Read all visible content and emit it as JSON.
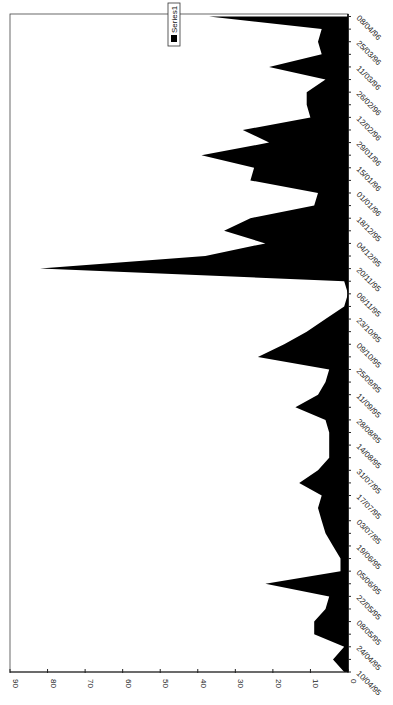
{
  "chart_data": {
    "type": "area",
    "orientation": "rotated-90-clockwise",
    "title": "",
    "xlabel": "",
    "ylabel": "",
    "ylim": [
      0,
      90
    ],
    "y_ticks": [
      0,
      10,
      20,
      30,
      40,
      50,
      60,
      70,
      80,
      90
    ],
    "x_tick_labels": [
      "10/04/95",
      "24/04/95",
      "08/05/95",
      "22/05/95",
      "05/06/95",
      "19/06/95",
      "03/07/95",
      "17/07/95",
      "31/07/95",
      "14/08/95",
      "28/08/95",
      "11/09/95",
      "25/09/95",
      "09/10/95",
      "23/10/95",
      "06/11/95",
      "20/11/95",
      "04/12/95",
      "18/12/95",
      "01/01/96",
      "15/01/96",
      "29/01/96",
      "12/02/96",
      "26/02/96",
      "11/03/96",
      "25/03/96",
      "08/04/96"
    ],
    "grid": false,
    "legend": {
      "position": "top",
      "entries": [
        "Series1"
      ]
    },
    "fill_color": "#000000",
    "x": [
      "10/04/95",
      "17/04/95",
      "24/04/95",
      "01/05/95",
      "08/05/95",
      "15/05/95",
      "22/05/95",
      "29/05/95",
      "05/06/95",
      "12/06/95",
      "19/06/95",
      "26/06/95",
      "03/07/95",
      "10/07/95",
      "17/07/95",
      "24/07/95",
      "31/07/95",
      "07/08/95",
      "14/08/95",
      "21/08/95",
      "28/08/95",
      "04/09/95",
      "11/09/95",
      "18/09/95",
      "25/09/95",
      "02/10/95",
      "09/10/95",
      "16/10/95",
      "23/10/95",
      "30/10/95",
      "06/11/95",
      "13/11/95",
      "20/11/95",
      "27/11/95",
      "04/12/95",
      "11/12/95",
      "18/12/95",
      "25/12/95",
      "01/01/96",
      "08/01/96",
      "15/01/96",
      "22/01/96",
      "29/01/96",
      "05/02/96",
      "12/02/96",
      "19/02/96",
      "26/02/96",
      "04/03/96",
      "11/03/96",
      "18/03/96",
      "25/03/96",
      "01/04/96",
      "08/04/96"
    ],
    "series": [
      {
        "name": "Series1",
        "values": [
          1,
          4,
          1,
          9,
          9,
          6,
          5,
          22,
          2,
          2,
          4,
          6,
          7,
          8,
          7,
          13,
          8,
          5,
          5,
          5,
          6,
          14,
          8,
          6,
          5,
          24,
          17,
          11,
          6,
          1,
          0,
          1,
          82,
          38,
          22,
          33,
          26,
          9,
          8,
          26,
          25,
          39,
          21,
          28,
          10,
          11,
          11,
          6,
          21,
          7,
          8,
          7,
          37
        ]
      }
    ]
  }
}
